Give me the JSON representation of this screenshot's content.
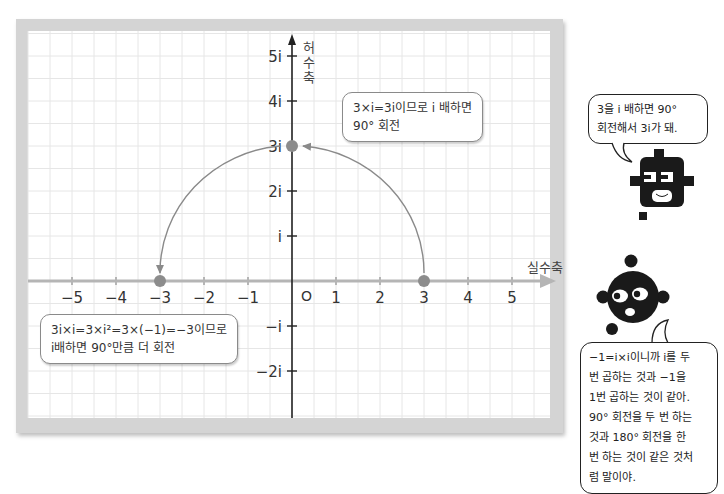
{
  "axes": {
    "real_label": "실수축",
    "imag_label": "허수축",
    "origin_label": "O",
    "real_ticks": [
      "−5",
      "−4",
      "−3",
      "−2",
      "−1",
      "1",
      "2",
      "3",
      "4",
      "5"
    ],
    "imag_ticks": [
      "5i",
      "4i",
      "3i",
      "2i",
      "i",
      "−i",
      "−2i"
    ]
  },
  "points": [
    {
      "label": "3",
      "x": 3,
      "y": 0
    },
    {
      "label": "3i",
      "x": 0,
      "y": 3
    },
    {
      "label": "−3",
      "x": -3,
      "y": 0
    }
  ],
  "callouts": {
    "top": {
      "line1": "3×i=3i이므로 i 배하면",
      "line2": "90° 회전"
    },
    "bottom": {
      "line1": "3i×i=3×i²=3×(−1)=−3이므로",
      "line2": "i배하면 90°만큼 더 회전"
    }
  },
  "characters": {
    "square_bubble": {
      "line1": "3을 i 배하면 90°",
      "line2": "회전해서 3i가 돼."
    },
    "round_bubble": {
      "lines": [
        "−1=i×i이니까 i를 두",
        "번 곱하는 것과 −1을",
        "1번 곱하는 것이 같아.",
        "90° 회전을 두 번 하는",
        "것과 180° 회전을 한",
        "번 하는 것이 같은 것처",
        "럼 말이야."
      ]
    }
  },
  "colors": {
    "frame": "#d4d4d4",
    "grid": "#e6e6e6",
    "real_axis": "#b5b5b5",
    "imag_axis": "#222222",
    "arc": "#888888",
    "point": "#8c8c8c",
    "character": "#1a1a1a"
  }
}
